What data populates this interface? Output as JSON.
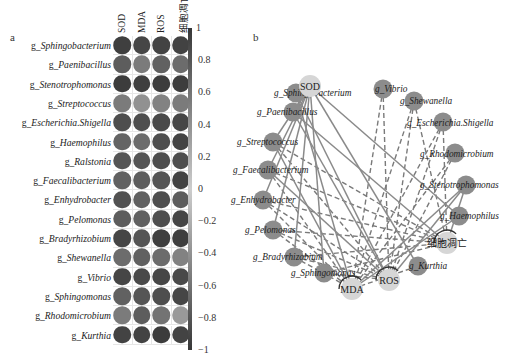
{
  "panel_a": {
    "label": "a",
    "columns": [
      "SOD",
      "MDA",
      "ROS",
      "细胞凋亡"
    ],
    "rows": [
      {
        "prefix": "g_",
        "name": "Sphingobacterium",
        "values": [
          0.95,
          0.9,
          0.92,
          0.93
        ]
      },
      {
        "prefix": "g_",
        "name": "Paenibacillus",
        "values": [
          0.75,
          0.55,
          0.72,
          0.65
        ]
      },
      {
        "prefix": "g_",
        "name": "Stenotrophomonas",
        "values": [
          0.97,
          0.95,
          0.97,
          0.96
        ]
      },
      {
        "prefix": "g_",
        "name": "Streptococcus",
        "values": [
          0.55,
          0.4,
          0.5,
          0.55
        ]
      },
      {
        "prefix": "g_",
        "name": "Escherichia.Shigella",
        "values": [
          0.85,
          0.85,
          0.88,
          0.9
        ]
      },
      {
        "prefix": "g_",
        "name": "Haemophilus",
        "values": [
          0.7,
          0.65,
          0.85,
          0.92
        ]
      },
      {
        "prefix": "g_",
        "name": "Ralstonia",
        "values": [
          0.8,
          0.8,
          0.85,
          0.85
        ]
      },
      {
        "prefix": "g_",
        "name": "Faecalibacterium",
        "values": [
          0.72,
          0.75,
          0.8,
          0.92
        ]
      },
      {
        "prefix": "g_",
        "name": "Enhydrobacter",
        "values": [
          0.82,
          0.72,
          0.85,
          0.75
        ]
      },
      {
        "prefix": "g_",
        "name": "Pelomonas",
        "values": [
          0.75,
          0.72,
          0.85,
          0.9
        ]
      },
      {
        "prefix": "g_",
        "name": "Bradyrhizobium",
        "values": [
          0.9,
          0.8,
          0.95,
          0.95
        ]
      },
      {
        "prefix": "g_",
        "name": "Shewanella",
        "values": [
          0.65,
          0.72,
          0.65,
          0.5
        ]
      },
      {
        "prefix": "g_",
        "name": "Vibrio",
        "values": [
          0.9,
          0.88,
          0.9,
          0.88
        ]
      },
      {
        "prefix": "g_",
        "name": "Sphingomonas",
        "values": [
          0.72,
          0.8,
          0.85,
          0.9
        ]
      },
      {
        "prefix": "g_",
        "name": "Rhodomicrobium",
        "values": [
          0.55,
          0.75,
          0.6,
          0.35
        ]
      },
      {
        "prefix": "g_",
        "name": "Kurthia",
        "values": [
          0.92,
          0.92,
          0.97,
          0.92
        ]
      }
    ],
    "colorbar": {
      "ticks": [
        "1",
        "0.8",
        "0.6",
        "0.4",
        "0.2",
        "0",
        "−0.2",
        "−0.4",
        "−0.6",
        "−0.8",
        "−1"
      ],
      "range": [
        -1,
        1
      ]
    }
  },
  "panel_b": {
    "label": "b",
    "target_nodes": [
      {
        "id": "SOD",
        "label": "SOD",
        "x": 310,
        "y": 86
      },
      {
        "id": "MDA",
        "label": "MDA",
        "x": 352,
        "y": 289
      },
      {
        "id": "ROS",
        "label": "ROS",
        "x": 389,
        "y": 280
      },
      {
        "id": "apoptosis",
        "label": "细胞凋亡",
        "x": 447,
        "y": 243
      }
    ],
    "genus_nodes": [
      {
        "id": "Sphingobacterium",
        "label": "g_Sphingobacterium",
        "x": 296,
        "y": 93,
        "lx": 274,
        "ly": 96,
        "anchor": "start"
      },
      {
        "id": "Paenibacillus",
        "label": "g_Paenibacillus",
        "x": 293,
        "y": 112,
        "lx": 257,
        "ly": 115,
        "anchor": "start"
      },
      {
        "id": "Streptococcus",
        "label": "g_Streptococcus",
        "x": 273,
        "y": 142,
        "lx": 237,
        "ly": 145,
        "anchor": "start"
      },
      {
        "id": "Faecalibacterium",
        "label": "g_Faecalibacterium",
        "x": 268,
        "y": 170,
        "lx": 233,
        "ly": 173,
        "anchor": "start"
      },
      {
        "id": "Enhydrobacter",
        "label": "g_Enhydrobacter",
        "x": 263,
        "y": 200,
        "lx": 231,
        "ly": 203,
        "anchor": "start"
      },
      {
        "id": "Pelomonas",
        "label": "g_Pelomonas",
        "x": 273,
        "y": 230,
        "lx": 245,
        "ly": 233,
        "anchor": "start"
      },
      {
        "id": "Bradyrhizobium",
        "label": "g_Bradyrhizobium",
        "x": 294,
        "y": 257,
        "lx": 253,
        "ly": 260,
        "anchor": "start"
      },
      {
        "id": "Sphingomonas",
        "label": "g_Sphingomonas",
        "x": 324,
        "y": 273,
        "lx": 291,
        "ly": 276,
        "anchor": "start"
      },
      {
        "id": "Kurthia",
        "label": "g_Kurthia",
        "x": 418,
        "y": 266,
        "lx": 409,
        "ly": 269,
        "anchor": "start"
      },
      {
        "id": "Haemophilus",
        "label": "g_Haemophilus",
        "x": 459,
        "y": 216,
        "lx": 440,
        "ly": 219,
        "anchor": "start"
      },
      {
        "id": "Stenotrophomonas",
        "label": "g_Stenotrophomonas",
        "x": 466,
        "y": 185,
        "lx": 420,
        "ly": 188,
        "anchor": "start"
      },
      {
        "id": "Rhodomicrobium",
        "label": "g_Rhodomicrobium",
        "x": 455,
        "y": 153,
        "lx": 420,
        "ly": 157,
        "anchor": "start"
      },
      {
        "id": "Escherichia.Shigella",
        "label": "g_Escherichia.Shigella",
        "x": 443,
        "y": 122,
        "lx": 407,
        "ly": 126,
        "anchor": "start"
      },
      {
        "id": "Shewanella",
        "label": "g_Shewanella",
        "x": 414,
        "y": 101,
        "lx": 400,
        "ly": 104,
        "anchor": "start"
      },
      {
        "id": "Vibrio",
        "label": "g_Vibrio",
        "x": 383,
        "y": 89,
        "lx": 375,
        "ly": 92,
        "anchor": "start"
      }
    ],
    "solid_edges": [
      [
        "Sphingobacterium",
        "SOD"
      ],
      [
        "Paenibacillus",
        "SOD"
      ],
      [
        "Streptococcus",
        "SOD"
      ],
      [
        "Faecalibacterium",
        "SOD"
      ],
      [
        "Enhydrobacter",
        "SOD"
      ],
      [
        "Pelomonas",
        "SOD"
      ],
      [
        "Bradyrhizobium",
        "SOD"
      ],
      [
        "Sphingomonas",
        "SOD"
      ],
      [
        "Paenibacillus",
        "apoptosis"
      ],
      [
        "Streptococcus",
        "MDA"
      ],
      [
        "Faecalibacterium",
        "ROS"
      ],
      [
        "Sphingobacterium",
        "ROS"
      ],
      [
        "Sphingobacterium",
        "MDA"
      ],
      [
        "Paenibacillus",
        "ROS"
      ],
      [
        "Stenotrophomonas",
        "MDA"
      ],
      [
        "Stenotrophomonas",
        "ROS"
      ],
      [
        "Haemophilus",
        "MDA"
      ],
      [
        "Kurthia",
        "SOD"
      ],
      [
        "Haemophilus",
        "SOD"
      ],
      [
        "Stenotrophomonas",
        "apoptosis"
      ]
    ],
    "dashed_edges": [
      [
        "Vibrio",
        "MDA"
      ],
      [
        "Vibrio",
        "ROS"
      ],
      [
        "Shewanella",
        "MDA"
      ],
      [
        "Shewanella",
        "apoptosis"
      ],
      [
        "Escherichia.Shigella",
        "MDA"
      ],
      [
        "Escherichia.Shigella",
        "apoptosis"
      ],
      [
        "Rhodomicrobium",
        "ROS"
      ],
      [
        "Rhodomicrobium",
        "MDA"
      ],
      [
        "Streptococcus",
        "apoptosis"
      ],
      [
        "Streptococcus",
        "ROS"
      ],
      [
        "Faecalibacterium",
        "apoptosis"
      ],
      [
        "Faecalibacterium",
        "MDA"
      ],
      [
        "Enhydrobacter",
        "apoptosis"
      ],
      [
        "Enhydrobacter",
        "ROS"
      ],
      [
        "Enhydrobacter",
        "MDA"
      ],
      [
        "Pelomonas",
        "apoptosis"
      ],
      [
        "Pelomonas",
        "ROS"
      ],
      [
        "Pelomonas",
        "MDA"
      ],
      [
        "Bradyrhizobium",
        "apoptosis"
      ],
      [
        "Bradyrhizobium",
        "ROS"
      ],
      [
        "Bradyrhizobium",
        "MDA"
      ],
      [
        "Sphingomonas",
        "apoptosis"
      ],
      [
        "Sphingomonas",
        "ROS"
      ],
      [
        "Kurthia",
        "MDA"
      ],
      [
        "Shewanella",
        "ROS"
      ],
      [
        "Escherichia.Shigella",
        "ROS"
      ]
    ]
  }
}
